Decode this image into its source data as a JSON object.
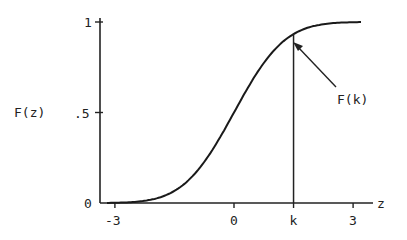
{
  "chart_data": {
    "type": "line",
    "title": "",
    "xlabel": "z",
    "ylabel": "F(z)",
    "x_ticks": [
      {
        "label": "-3",
        "value": -3
      },
      {
        "label": "0",
        "value": 0
      },
      {
        "label": "k",
        "value": 1.5
      },
      {
        "label": "3",
        "value": 3
      }
    ],
    "y_ticks": [
      {
        "label": "0",
        "value": 0
      },
      {
        "label": ".5",
        "value": 0.5
      },
      {
        "label": "1",
        "value": 1
      }
    ],
    "xlim": [
      -3.5,
      3.6
    ],
    "ylim": [
      0,
      1
    ],
    "grid": false,
    "series": [
      {
        "name": "F(z)",
        "description": "cumulative distribution function (standard normal shape)",
        "x": [
          -3,
          -2.5,
          -2,
          -1.5,
          -1,
          -0.5,
          0,
          0.5,
          1,
          1.5,
          2,
          2.5,
          3
        ],
        "values": [
          0.001,
          0.006,
          0.023,
          0.067,
          0.159,
          0.309,
          0.5,
          0.691,
          0.841,
          0.933,
          0.977,
          0.994,
          0.999
        ]
      }
    ],
    "annotations": [
      {
        "text": "F(k)",
        "type": "arrow",
        "points_to": {
          "x": 1.5,
          "y": 0.933
        },
        "note": "vertical line drawn from z=k up to the curve"
      }
    ]
  },
  "labels": {
    "ylabel": "F(z)",
    "xlabel": "z",
    "annotation": "F(k)"
  }
}
